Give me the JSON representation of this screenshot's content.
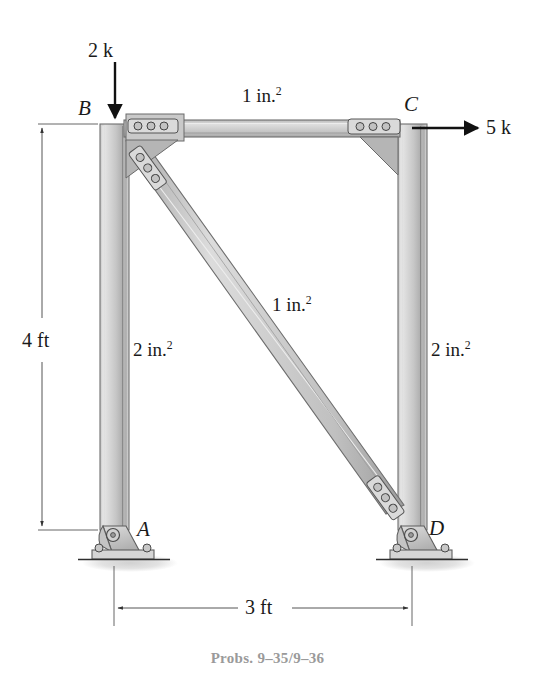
{
  "figure": {
    "caption": "Probs. 9–35/9–36",
    "joints": [
      {
        "id": "B",
        "label": "B",
        "x": 114,
        "y": 124,
        "label_x": 78,
        "label_y": 100
      },
      {
        "id": "C",
        "label": "C",
        "x": 412,
        "y": 124,
        "label_x": 404,
        "label_y": 96
      },
      {
        "id": "A",
        "label": "A",
        "x": 114,
        "y": 528,
        "label_x": 137,
        "label_y": 522
      },
      {
        "id": "D",
        "label": "D",
        "x": 412,
        "y": 528,
        "label_x": 428,
        "label_y": 521
      }
    ],
    "loads": [
      {
        "name": "vertical-load-at-b",
        "label": "2 k",
        "magnitude": 2,
        "unit": "k",
        "direction": "down",
        "applied_at": "B",
        "label_x": 88,
        "label_y": 44
      },
      {
        "name": "horizontal-load-at-c",
        "label": "5 k",
        "magnitude": 5,
        "unit": "k",
        "direction": "right",
        "applied_at": "C",
        "label_x": 486,
        "label_y": 125
      }
    ],
    "members": [
      {
        "name": "top-chord-BC",
        "from": "B",
        "to": "C",
        "area_label": "1 in.",
        "area_exponent": "2",
        "area_value": 1,
        "area_unit": "in.^2",
        "label_x": 242,
        "label_y": 93
      },
      {
        "name": "diagonal-BD",
        "from": "B",
        "to": "D",
        "area_label": "1 in.",
        "area_exponent": "2",
        "area_value": 1,
        "area_unit": "in.^2",
        "label_x": 272,
        "label_y": 302
      },
      {
        "name": "left-column-AB",
        "from": "A",
        "to": "B",
        "area_label": "2 in.",
        "area_exponent": "2",
        "area_value": 2,
        "area_unit": "in.^2",
        "label_x": 132,
        "label_y": 347
      },
      {
        "name": "right-column-CD",
        "from": "C",
        "to": "D",
        "area_label": "2 in.",
        "area_exponent": "2",
        "area_value": 2,
        "area_unit": "in.^2",
        "label_x": 431,
        "label_y": 347
      }
    ],
    "dimensions": [
      {
        "name": "height-dimension",
        "label": "4 ft",
        "value": 4,
        "unit": "ft",
        "orientation": "vertical",
        "label_x": 22,
        "label_y": 340
      },
      {
        "name": "span-dimension",
        "label": "3 ft",
        "value": 3,
        "unit": "ft",
        "orientation": "horizontal",
        "label_x": 245,
        "label_y": 597
      }
    ],
    "supports": [
      {
        "name": "pin-support-a",
        "at": "A",
        "type": "pin"
      },
      {
        "name": "pin-support-d",
        "at": "D",
        "type": "pin"
      }
    ],
    "colors": {
      "steel_light": "#d8d8d8",
      "steel_mid": "#bdbdbd",
      "steel_dark": "#8f8f8f",
      "outline": "#4a4a4a",
      "ink": "#1a1a1a",
      "caption": "#9a9a9a",
      "shadow": "#d2d2d2"
    }
  }
}
